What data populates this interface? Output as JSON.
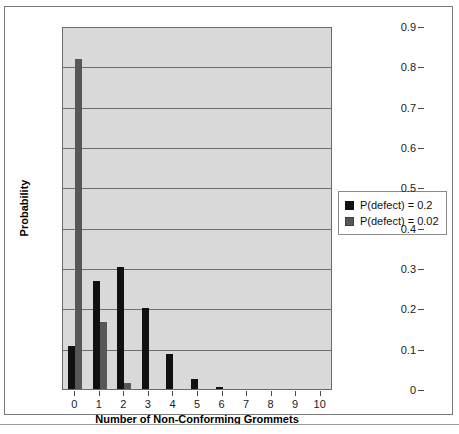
{
  "chart_data": {
    "type": "bar",
    "title": "",
    "xlabel": "Number of Non-Conforming Grommets",
    "ylabel": "Probability",
    "categories": [
      "0",
      "1",
      "2",
      "3",
      "4",
      "5",
      "6",
      "7",
      "8",
      "9",
      "10"
    ],
    "ylim": [
      0,
      0.9
    ],
    "ytick_labels": [
      "0",
      "0.1",
      "0.2",
      "0.3",
      "0.4",
      "0.5",
      "0.6",
      "0.7",
      "0.8",
      "0.9"
    ],
    "ytick_values": [
      0,
      0.1,
      0.2,
      0.3,
      0.4,
      0.5,
      0.6,
      0.7,
      0.8,
      0.9
    ],
    "grid": true,
    "legend_position": "right",
    "series": [
      {
        "name": "P(defect) = 0.2",
        "color": "#111111",
        "values": [
          0.107,
          0.268,
          0.302,
          0.201,
          0.088,
          0.026,
          0.0055,
          0.0008,
          0.0001,
          0.0,
          0.0
        ]
      },
      {
        "name": "P(defect) = 0.02",
        "color": "#575757",
        "values": [
          0.817,
          0.167,
          0.0153,
          0.0008,
          0.0,
          0.0,
          0.0,
          0.0,
          0.0,
          0.0,
          0.0
        ]
      }
    ]
  },
  "legend": {
    "items": [
      {
        "label": "P(defect) = 0.2",
        "swatch": "black-swatch"
      },
      {
        "label": "P(defect) = 0.02",
        "swatch": "gray-swatch"
      }
    ]
  }
}
